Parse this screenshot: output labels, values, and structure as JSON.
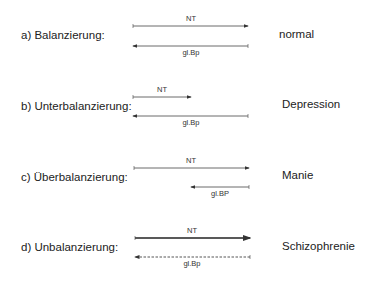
{
  "rows": [
    {
      "label": "a)  Balanzierung:",
      "result": "normal",
      "nt_label": "NT",
      "gb_label": "gl.Bp"
    },
    {
      "label": "b)  Unterbalanzierung:",
      "result": "Depression",
      "nt_label": "NT",
      "gb_label": "gl.Bp"
    },
    {
      "label": "c)  Überbalanzierung:",
      "result": "Manie",
      "nt_label": "NT",
      "gb_label": "gl.BP"
    },
    {
      "label": "d)  Unbalanzierung:",
      "result": "Schizophrenie",
      "nt_label": "NT",
      "gb_label": "gl.Bp"
    }
  ],
  "colors": {
    "line": "#333333",
    "text": "#222222"
  }
}
